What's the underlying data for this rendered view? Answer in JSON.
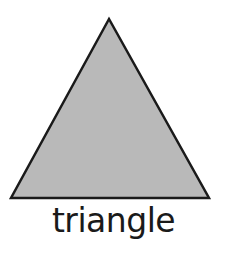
{
  "figure": {
    "shape": "triangle",
    "label": "triangle",
    "fill_color": "#b9b9b9",
    "stroke_color": "#1a1a1a"
  }
}
